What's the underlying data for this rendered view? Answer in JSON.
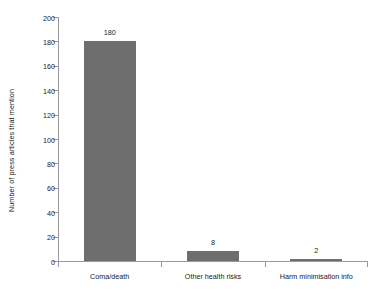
{
  "chart_data": {
    "type": "bar",
    "title": "",
    "subtitle": "",
    "xlabel": "",
    "ylabel": "Number of press articles that mention",
    "categories": [
      "Coma/death",
      "Other health risks",
      "Harm minimisation info"
    ],
    "values": [
      180,
      8,
      2
    ],
    "value_labels": [
      "180",
      "8",
      "2"
    ],
    "ylim": [
      0,
      200
    ],
    "ytick_step": 20,
    "ytick_labels": [
      "0",
      "20",
      "40",
      "60",
      "80",
      "100",
      "120",
      "140",
      "160",
      "180",
      "200"
    ],
    "grid": false,
    "legend": false,
    "legend_position": "none",
    "series": [
      {
        "name": "Number of press articles that mention",
        "values": [
          180,
          8,
          2
        ]
      }
    ],
    "colors": {
      "bar": "#6e6e6e",
      "axis": "#9a9a9a",
      "text": "#1a1a1a",
      "background": "#ffffff"
    }
  }
}
